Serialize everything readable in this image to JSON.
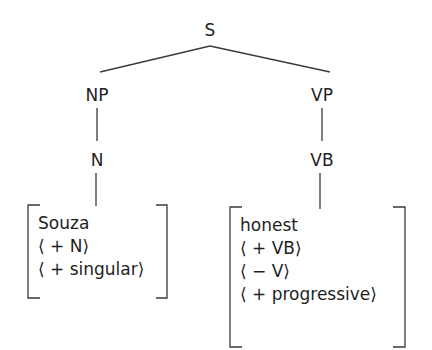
{
  "tree": {
    "root": {
      "label": "S"
    },
    "nodes": {
      "np": {
        "label": "NP"
      },
      "vp": {
        "label": "VP"
      },
      "n": {
        "label": "N"
      },
      "vb": {
        "label": "VB"
      }
    },
    "edges": [
      {
        "from": "S",
        "to": "NP"
      },
      {
        "from": "S",
        "to": "VP"
      },
      {
        "from": "NP",
        "to": "N"
      },
      {
        "from": "VP",
        "to": "VB"
      },
      {
        "from": "N",
        "to": "Souza-matrix"
      },
      {
        "from": "VB",
        "to": "honest-matrix"
      }
    ],
    "matrices": {
      "left": {
        "lines": [
          "Souza",
          "⟨ + N⟩",
          "⟨ + singular⟩"
        ]
      },
      "right": {
        "lines": [
          "honest",
          "⟨ + VB⟩",
          "⟨ − V⟩",
          "⟨ + progressive⟩"
        ]
      }
    }
  },
  "colors": {
    "ink": "#1e1e1e",
    "background": "#ffffff"
  }
}
